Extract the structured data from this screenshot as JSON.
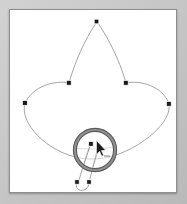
{
  "app": {
    "title": "Vector Path Editor Canvas",
    "canvas_background": "#ffffff",
    "window_background": "#c9c9c9",
    "frame_border_color": "#8e8e8e"
  },
  "canvas": {
    "name": "drawing-canvas",
    "width": 168,
    "height": 184,
    "origin_x": 9,
    "origin_y": 9
  },
  "artwork": {
    "name": "four-petal-flower-path",
    "description": "Closed bezier path forming a four lobed flower / fleur shape",
    "stroke_color": "#9a9a9a",
    "stroke_width": "0.9",
    "fill": "none",
    "anchor_color": "#1a1a1a",
    "anchor_count": 5,
    "anchors": [
      {
        "label": "anchor-top",
        "x": 97,
        "y": 22
      },
      {
        "label": "anchor-inner-left",
        "x": 69,
        "y": 83
      },
      {
        "label": "anchor-inner-right",
        "x": 126,
        "y": 83
      },
      {
        "label": "anchor-left",
        "x": 25,
        "y": 103
      },
      {
        "label": "anchor-right",
        "x": 169,
        "y": 104
      },
      {
        "label": "anchor-in-loupe",
        "x": 91,
        "y": 144
      },
      {
        "label": "anchor-handle-tail-left",
        "x": 77,
        "y": 182
      },
      {
        "label": "anchor-handle-tail-right",
        "x": 89,
        "y": 182
      }
    ]
  },
  "loupe": {
    "name": "magnifier-loupe",
    "center_x": 95,
    "center_y": 150,
    "radius": 21,
    "ring_color": "#8c8c8c",
    "inner_ring_color": "#5a5a5a",
    "glass_tint": "rgba(255,255,255,0.55)"
  },
  "cursor": {
    "name": "pen-tool-cursor",
    "x": 97,
    "y": 146,
    "glyph": "arrow-pointer"
  },
  "labels": {
    "title": "Vector Path Editor Canvas",
    "artwork_name": "four-petal-flower-path",
    "loupe_name": "magnifier-loupe",
    "cursor_name": "pen-tool-cursor"
  }
}
